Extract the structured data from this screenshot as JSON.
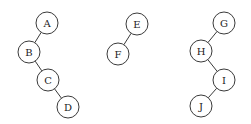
{
  "diagram": {
    "type": "binary-tree-forest",
    "node_radius": 11,
    "colors": {
      "stroke": "#3a3a3a",
      "fill": "#ffffff",
      "text": "#222222",
      "background": "#ffffff"
    },
    "trees": [
      {
        "root": "A",
        "nodes": [
          {
            "id": "A",
            "label": "A",
            "x": 47,
            "y": 23
          },
          {
            "id": "B",
            "label": "B",
            "x": 29,
            "y": 52
          },
          {
            "id": "C",
            "label": "C",
            "x": 48,
            "y": 80
          },
          {
            "id": "D",
            "label": "D",
            "x": 68,
            "y": 107
          }
        ],
        "edges": [
          [
            "A",
            "B"
          ],
          [
            "B",
            "C"
          ],
          [
            "C",
            "D"
          ]
        ]
      },
      {
        "root": "E",
        "nodes": [
          {
            "id": "E",
            "label": "E",
            "x": 137,
            "y": 24
          },
          {
            "id": "F",
            "label": "F",
            "x": 118,
            "y": 54
          }
        ],
        "edges": [
          [
            "E",
            "F"
          ]
        ]
      },
      {
        "root": "G",
        "nodes": [
          {
            "id": "G",
            "label": "G",
            "x": 224,
            "y": 23
          },
          {
            "id": "H",
            "label": "H",
            "x": 201,
            "y": 51
          },
          {
            "id": "I",
            "label": "I",
            "x": 224,
            "y": 80
          },
          {
            "id": "J",
            "label": "J",
            "x": 201,
            "y": 106
          }
        ],
        "edges": [
          [
            "G",
            "H"
          ],
          [
            "H",
            "I"
          ],
          [
            "I",
            "J"
          ]
        ]
      }
    ]
  }
}
